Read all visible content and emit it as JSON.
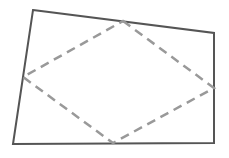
{
  "diagram": {
    "title": "",
    "quadrilateral": {
      "stroke": "#555555",
      "stroke_width": 2,
      "vertices": [
        [
          33,
          10
        ],
        [
          214,
          33
        ],
        [
          214,
          143
        ],
        [
          13,
          144
        ]
      ]
    },
    "midpoint_quadrilateral": {
      "stroke": "#999999",
      "stroke_width": 2.5,
      "dash": "9,6",
      "vertices": [
        [
          123,
          21
        ],
        [
          214,
          88
        ],
        [
          113,
          143
        ],
        [
          23,
          77
        ]
      ]
    }
  }
}
